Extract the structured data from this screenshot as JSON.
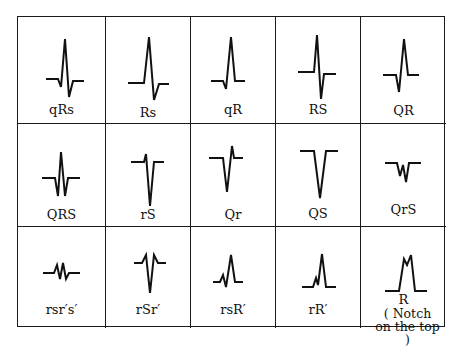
{
  "figure": {
    "rows": [
      [
        {
          "label": "qRs",
          "path": "M28,62 L40,62 L43,70 L47,22 L51,80 L55,64 L66,64"
        },
        {
          "label": "Rs",
          "path": "M22,66 L38,66 L43,20 L48,83 L53,67 L63,67"
        },
        {
          "label": "qR",
          "path": "M20,64 L32,64 L35,72 L40,20 L44,64 L54,64"
        },
        {
          "label": "RS",
          "path": "M22,55 L38,55 L41,18 L45,82 L48,57 L60,57"
        },
        {
          "label": "QR",
          "path": "M22,58 L35,58 L38,75 L43,22 L47,58 L58,58"
        }
      ],
      [
        {
          "label": "QRS",
          "path": "M24,54 L37,54 L40,72 L43,28 L47,72 L50,54 L62,54"
        },
        {
          "label": "rS",
          "path": "M25,38 L38,38 L40,30 L44,82 L48,38 L58,38"
        },
        {
          "label": "Qr",
          "path": "M18,34 L32,34 L36,68 L41,22 L43,34 L52,34"
        },
        {
          "label": "QS",
          "path": "M24,27 L38,27 L44,74 L50,27 L62,27"
        },
        {
          "label": "QrS",
          "path": "M24,39 L36,39 L39,52 L42,41 L45,58 L48,39 L60,39"
        }
      ],
      [
        {
          "label": "rsr′s′",
          "path": "M25,46 L36,46 L39,38 L42,52 L45,36 L48,52 L51,46 L62,46"
        },
        {
          "label": "rSr′",
          "path": "M28,36 L36,36 L40,28 L44,66 L48,28 L52,36 L60,36"
        },
        {
          "label": "rsR′",
          "path": "M22,55 L29,55 L32,48 L35,60 L40,28 L44,55 L52,55"
        },
        {
          "label": "rR′",
          "path": "M26,60 L37,60 L40,51 L42,58 L46,27 L50,60 L60,60"
        },
        {
          "label": "R",
          "sublabel": "( Notch on the top )",
          "path": "M24,64 L38,64 L43,32 L46,38 L50,28 L54,64 L66,64"
        }
      ]
    ],
    "stroke_color": "#111111",
    "background": "#ffffff",
    "grid_color": "#1a1a1a"
  }
}
